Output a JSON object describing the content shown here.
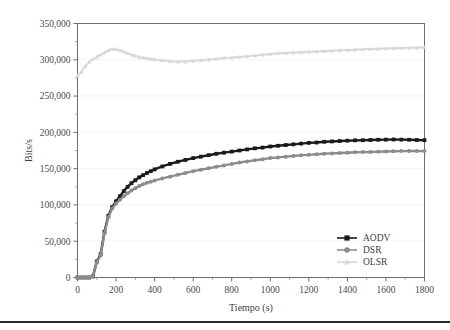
{
  "chart_data": {
    "type": "line",
    "title": "",
    "xlabel": "Tiempo (s)",
    "ylabel": "Bits/s",
    "xlim": [
      0,
      1800
    ],
    "ylim": [
      0,
      350000
    ],
    "grid": true,
    "legend_position": "bottom-right",
    "xticks": [
      0,
      200,
      400,
      600,
      800,
      1000,
      1200,
      1400,
      1600,
      1800
    ],
    "xtick_labels": [
      "0",
      "200",
      "400",
      "600",
      "800",
      "1000",
      "1200",
      "1400",
      "1600",
      "1800"
    ],
    "yticks": [
      0,
      50000,
      100000,
      150000,
      200000,
      250000,
      300000,
      350000
    ],
    "ytick_labels": [
      "0",
      "50,000",
      "100,000",
      "150,000",
      "200,000",
      "250,000",
      "300,000",
      "350,000"
    ],
    "x": [
      0,
      20,
      40,
      60,
      80,
      100,
      120,
      140,
      160,
      180,
      200,
      220,
      240,
      260,
      280,
      300,
      320,
      340,
      360,
      380,
      400,
      440,
      480,
      520,
      560,
      600,
      640,
      680,
      720,
      760,
      800,
      840,
      880,
      920,
      960,
      1000,
      1040,
      1080,
      1120,
      1160,
      1200,
      1240,
      1280,
      1320,
      1360,
      1400,
      1440,
      1480,
      1520,
      1560,
      1600,
      1640,
      1680,
      1720,
      1760,
      1800
    ],
    "series": [
      {
        "name": "AODV",
        "color": "#1a1a1a",
        "marker": "square",
        "values": [
          0,
          0,
          0,
          0,
          1500,
          22000,
          32000,
          63000,
          85000,
          97000,
          105000,
          112000,
          119000,
          125000,
          130000,
          134000,
          138000,
          141000,
          144000,
          146500,
          149000,
          153000,
          156500,
          159500,
          162000,
          164500,
          166500,
          168500,
          170500,
          172000,
          173500,
          175000,
          176500,
          178000,
          179000,
          180500,
          181500,
          182500,
          183500,
          184500,
          185500,
          186000,
          187000,
          187500,
          188000,
          188500,
          189000,
          189200,
          189500,
          189800,
          190000,
          190200,
          190000,
          189800,
          189500,
          189200
        ]
      },
      {
        "name": "DSR",
        "color": "#8c8c8c",
        "marker": "circle",
        "values": [
          0,
          0,
          0,
          0,
          1500,
          21000,
          30500,
          61000,
          83000,
          95000,
          102000,
          107000,
          112000,
          116000,
          120000,
          123000,
          126000,
          128500,
          130500,
          132000,
          133500,
          136500,
          139000,
          141500,
          144000,
          146500,
          148500,
          150500,
          152500,
          154500,
          156500,
          158500,
          160000,
          161500,
          163000,
          164500,
          165500,
          166500,
          167500,
          168500,
          169000,
          169800,
          170500,
          171000,
          171500,
          172000,
          172500,
          172800,
          173000,
          173300,
          173600,
          174000,
          174200,
          174300,
          174300,
          174200
        ]
      },
      {
        "name": "OLSR",
        "color": "#d8d8d8",
        "marker": "triangle",
        "values": [
          278000,
          283000,
          291000,
          297000,
          301000,
          304000,
          307000,
          310000,
          313000,
          315000,
          314500,
          313000,
          311000,
          309000,
          307000,
          305500,
          304000,
          303000,
          302000,
          301000,
          300500,
          299500,
          298000,
          297500,
          297500,
          298500,
          299500,
          300500,
          301500,
          302500,
          303000,
          304000,
          305000,
          306000,
          307000,
          308000,
          309000,
          309500,
          310000,
          310500,
          311000,
          311500,
          312000,
          312500,
          313000,
          313500,
          314000,
          314500,
          315000,
          315200,
          315500,
          316000,
          316200,
          316500,
          316800,
          317000
        ]
      }
    ]
  },
  "legend": {
    "entries": [
      {
        "label": "AODV",
        "marker": "square-marker-icon"
      },
      {
        "label": "DSR",
        "marker": "circle-marker-icon"
      },
      {
        "label": "OLSR",
        "marker": "triangle-marker-icon"
      }
    ]
  }
}
